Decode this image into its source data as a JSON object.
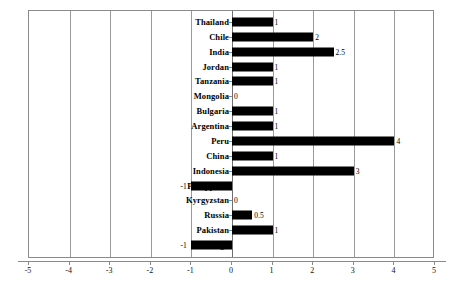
{
  "chart_data": {
    "type": "bar",
    "orientation": "horizontal",
    "title": "",
    "subtitle": "",
    "xlabel": "",
    "ylabel": "",
    "xlim": [
      -5,
      5
    ],
    "xticks": [
      -5,
      -4,
      -3,
      -2,
      -1,
      0,
      1,
      2,
      3,
      4,
      5
    ],
    "xtick_labels": [
      "-5",
      "-4",
      "-3",
      "-2",
      "-1",
      "0",
      "1",
      "2",
      "3",
      "4",
      "5"
    ],
    "grid": true,
    "grid_axis": "x",
    "legend": false,
    "legend_position": "none",
    "bar_color": "#000000",
    "categories": [
      "Thailand",
      "Chile",
      "India",
      "Jordan",
      "Tanzania",
      "Mongolia",
      "Bulgaria",
      "Argentina",
      "Peru",
      "China",
      "Indonesia",
      "Philippines",
      "Kyrgyzstan",
      "Russia",
      "Pakistan",
      "Togo"
    ],
    "values": [
      1,
      2,
      2.5,
      1,
      1,
      0,
      1,
      1,
      4,
      1,
      3,
      -1,
      0,
      0.5,
      1,
      -1
    ],
    "data_labels": [
      "1",
      "2",
      "2.5",
      "1",
      "1",
      "0",
      "1",
      "1",
      "4",
      "1",
      "3",
      "-1",
      "0",
      "0.5",
      "1",
      "-1"
    ]
  }
}
